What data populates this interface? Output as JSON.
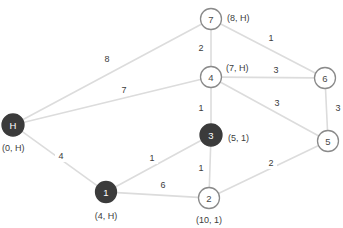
{
  "diagram": {
    "background_color": "#ffffff",
    "edge_color": "#dcdcdc",
    "node_fill_visited": "#3b3b3b",
    "node_fill_unvisited": "#ffffff",
    "node_stroke_unvisited": "#8a8a8a",
    "text_color": "#3c3c3c"
  },
  "nodes": [
    {
      "id": "H",
      "label": "H",
      "x": 13,
      "y": 125,
      "r": 11,
      "state": "visited",
      "annotation": "(0, H)",
      "annot_x": 2,
      "annot_y": 148,
      "annot_anchor": "start"
    },
    {
      "id": "1",
      "label": "1",
      "x": 106,
      "y": 192,
      "r": 10.5,
      "state": "visited",
      "annotation": "(4, H)",
      "annot_x": 106,
      "annot_y": 216,
      "annot_anchor": "middle"
    },
    {
      "id": "2",
      "label": "2",
      "x": 209,
      "y": 198,
      "r": 10.5,
      "state": "unvisited",
      "annotation": "(10, 1)",
      "annot_x": 209,
      "annot_y": 220,
      "annot_anchor": "middle"
    },
    {
      "id": "3",
      "label": "3",
      "x": 211,
      "y": 135,
      "r": 11,
      "state": "visited",
      "annotation": "(5, 1)",
      "annot_x": 228,
      "annot_y": 138,
      "annot_anchor": "start"
    },
    {
      "id": "4",
      "label": "4",
      "x": 211,
      "y": 77,
      "r": 10.5,
      "state": "unvisited",
      "annotation": "(7, H)",
      "annot_x": 226,
      "annot_y": 68,
      "annot_anchor": "start"
    },
    {
      "id": "5",
      "label": "5",
      "x": 328,
      "y": 141,
      "r": 10.5,
      "state": "unvisited",
      "annotation": "",
      "annot_x": 0,
      "annot_y": 0,
      "annot_anchor": "middle"
    },
    {
      "id": "6",
      "label": "6",
      "x": 325,
      "y": 78,
      "r": 10.5,
      "state": "unvisited",
      "annotation": "",
      "annot_x": 0,
      "annot_y": 0,
      "annot_anchor": "middle"
    },
    {
      "id": "7",
      "label": "7",
      "x": 211,
      "y": 19,
      "r": 10.5,
      "state": "unvisited",
      "annotation": "(8, H)",
      "annot_x": 227,
      "annot_y": 18,
      "annot_anchor": "start"
    }
  ],
  "edges": [
    {
      "from": "H",
      "to": "7",
      "weight": "8",
      "wx": 107,
      "wy": 59
    },
    {
      "from": "H",
      "to": "4",
      "weight": "7",
      "wx": 124,
      "wy": 90
    },
    {
      "from": "H",
      "to": "1",
      "weight": "4",
      "wx": 61,
      "wy": 156
    },
    {
      "from": "7",
      "to": "4",
      "weight": "2",
      "wx": 201,
      "wy": 48
    },
    {
      "from": "7",
      "to": "6",
      "weight": "1",
      "wx": 271,
      "wy": 38
    },
    {
      "from": "4",
      "to": "6",
      "weight": "3",
      "wx": 276,
      "wy": 70
    },
    {
      "from": "4",
      "to": "5",
      "weight": "3",
      "wx": 277,
      "wy": 103
    },
    {
      "from": "4",
      "to": "3",
      "weight": "1",
      "wx": 201,
      "wy": 108
    },
    {
      "from": "6",
      "to": "5",
      "weight": "3",
      "wx": 338,
      "wy": 108
    },
    {
      "from": "3",
      "to": "1",
      "weight": "1",
      "wx": 152,
      "wy": 158
    },
    {
      "from": "3",
      "to": "2",
      "weight": "1",
      "wx": 201,
      "wy": 168
    },
    {
      "from": "1",
      "to": "2",
      "weight": "6",
      "wx": 163,
      "wy": 185
    },
    {
      "from": "2",
      "to": "5",
      "weight": "2",
      "wx": 271,
      "wy": 163
    }
  ],
  "graph_data": {
    "type": "node-link-diagram",
    "directed": false,
    "weighted": true,
    "node_ids": [
      "H",
      "1",
      "2",
      "3",
      "4",
      "5",
      "6",
      "7"
    ],
    "visited_nodes": [
      "H",
      "1",
      "3"
    ],
    "unvisited_nodes": [
      "2",
      "4",
      "5",
      "6",
      "7"
    ],
    "node_annotations": {
      "H": {
        "distance": 0,
        "predecessor": "H",
        "text": "(0, H)"
      },
      "1": {
        "distance": 4,
        "predecessor": "H",
        "text": "(4, H)"
      },
      "2": {
        "distance": 10,
        "predecessor": "1",
        "text": "(10, 1)"
      },
      "3": {
        "distance": 5,
        "predecessor": "1",
        "text": "(5, 1)"
      },
      "4": {
        "distance": 7,
        "predecessor": "H",
        "text": "(7, H)"
      },
      "7": {
        "distance": 8,
        "predecessor": "H",
        "text": "(8, H)"
      }
    },
    "edge_list": [
      [
        "H",
        "7",
        8
      ],
      [
        "H",
        "4",
        7
      ],
      [
        "H",
        "1",
        4
      ],
      [
        "7",
        "4",
        2
      ],
      [
        "7",
        "6",
        1
      ],
      [
        "4",
        "6",
        3
      ],
      [
        "4",
        "5",
        3
      ],
      [
        "4",
        "3",
        1
      ],
      [
        "6",
        "5",
        3
      ],
      [
        "3",
        "1",
        1
      ],
      [
        "3",
        "2",
        1
      ],
      [
        "1",
        "2",
        6
      ],
      [
        "2",
        "5",
        2
      ]
    ]
  }
}
